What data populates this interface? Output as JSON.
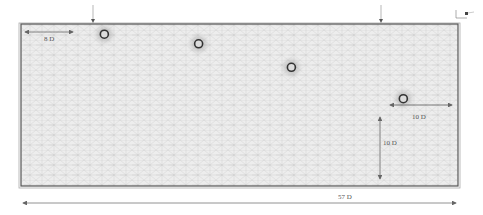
{
  "figure": {
    "domain_length_label": "57 D",
    "inlet_offset_label": "8 D",
    "outlet_offset_label": "10 D",
    "bottom_offset_label": "10 D"
  },
  "cylinders": [
    {
      "name": "cylinder-1",
      "x_D": 8.0,
      "y_D": 0.6
    },
    {
      "name": "cylinder-2",
      "x_D": 20.3,
      "y_D": 1.7
    },
    {
      "name": "cylinder-3",
      "x_D": 32.4,
      "y_D": 4.4
    },
    {
      "name": "cylinder-4",
      "x_D": 47.0,
      "y_D": 8.0
    }
  ],
  "domain": {
    "width_D": 57,
    "height_D": 18.6
  },
  "colors": {
    "mesh_line": "#b8b8b8",
    "mesh_fill": "#ececec",
    "border": "#555555",
    "arrow": "#666666",
    "cylinder": "#333333"
  }
}
